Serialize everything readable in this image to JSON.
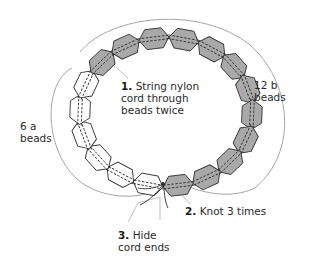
{
  "diagram": {
    "type": "bead-ring-instructions",
    "colors": {
      "bead_a_fill": "#ffffff",
      "bead_b_fill": "#a9a9a9",
      "bead_stroke": "#333333",
      "cord": "#333333",
      "bracket_arc": "#9a9a9a",
      "leader_line": "#b0b0b0",
      "text": "#2a2a2a"
    },
    "bead_groups": [
      {
        "id": "a",
        "count": 6,
        "label_line1": "6 a",
        "label_line2": "beads"
      },
      {
        "id": "b",
        "count": 12,
        "label_line1": "12 b",
        "label_line2": "beads"
      }
    ],
    "steps": [
      {
        "number": "1.",
        "line1": "String nylon",
        "line2": "cord through",
        "line3": "beads twice"
      },
      {
        "number": "2.",
        "line1": "Knot 3 times"
      },
      {
        "number": "3.",
        "line1": "Hide",
        "line2": "cord ends"
      }
    ]
  }
}
